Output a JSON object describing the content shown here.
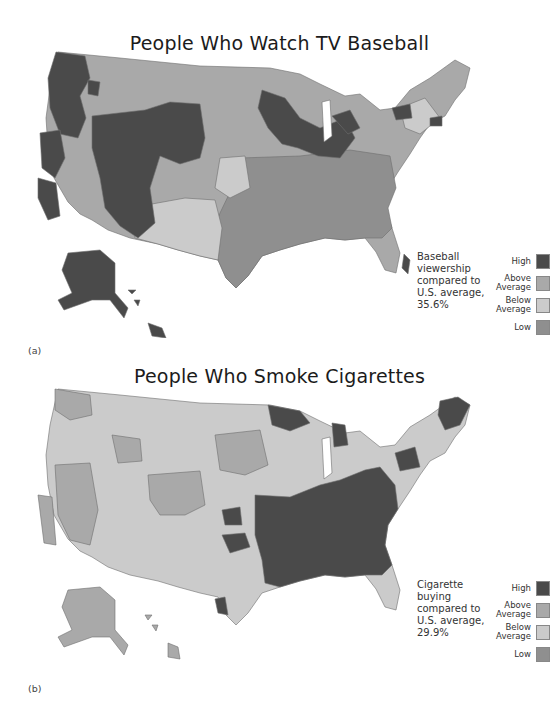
{
  "colors": {
    "high": "#4a4a4a",
    "above_average": "#a9a9a9",
    "below_average": "#cbcbcb",
    "low": "#8f8f8f",
    "border": "#6e6e6e"
  },
  "panels": [
    {
      "id": "a",
      "label": "(a)",
      "title": "People Who Watch TV Baseball",
      "caption_lines": [
        "Baseball",
        "viewership",
        "compared to",
        "U.S. average,",
        "35.6%"
      ],
      "caption": "Baseball viewership compared to U.S. average, 35.6%",
      "legend": [
        {
          "label": "High",
          "key": "high"
        },
        {
          "label": "Above Average",
          "key": "above_average"
        },
        {
          "label": "Below Average",
          "key": "below_average"
        },
        {
          "label": "Low",
          "key": "low"
        }
      ],
      "regions_summary": {
        "high": [
          "Washington/Oregon",
          "Northern California coast",
          "Utah/Colorado/Wyoming",
          "Arizona",
          "Minnesota/Wisconsin/Iowa",
          "Illinois/Michigan",
          "Upstate New York",
          "Connecticut",
          "Alaska",
          "Hawaii",
          "Southeast Florida"
        ],
        "low": [
          "Southeast",
          "Texas coast",
          "Gulf states",
          "Mid-Atlantic"
        ],
        "below_average": [
          "Southwest/New Mexico",
          "Great Plains portions",
          "New England portions"
        ],
        "above_average": [
          "Mountain West",
          "Plains",
          "Northeast"
        ]
      }
    },
    {
      "id": "b",
      "label": "(b)",
      "title": "People Who Smoke Cigarettes",
      "caption_lines": [
        "Cigarette",
        "buying",
        "compared to",
        "U.S. average,",
        "29.9%"
      ],
      "caption": "Cigarette buying compared to U.S. average, 29.9%",
      "legend": [
        {
          "label": "High",
          "key": "high"
        },
        {
          "label": "Above Average",
          "key": "above_average"
        },
        {
          "label": "Below Average",
          "key": "below_average"
        },
        {
          "label": "Low",
          "key": "low"
        }
      ],
      "regions_summary": {
        "high": [
          "Southeast",
          "Appalachia",
          "Mid-South",
          "Maine",
          "Northern Minnesota",
          "Northern Michigan",
          "Upstate New York",
          "Arkansas/Oklahoma pocket",
          "South Texas border"
        ],
        "above_average": [
          "Nevada",
          "Colorado",
          "Dakotas/Minnesota",
          "Washington",
          "Alaska",
          "Hawaii"
        ],
        "below_average": [
          "Utah/Idaho",
          "Great Plains",
          "Texas",
          "Midwest",
          "New England"
        ],
        "low": [
          "Scattered western areas"
        ]
      }
    }
  ]
}
